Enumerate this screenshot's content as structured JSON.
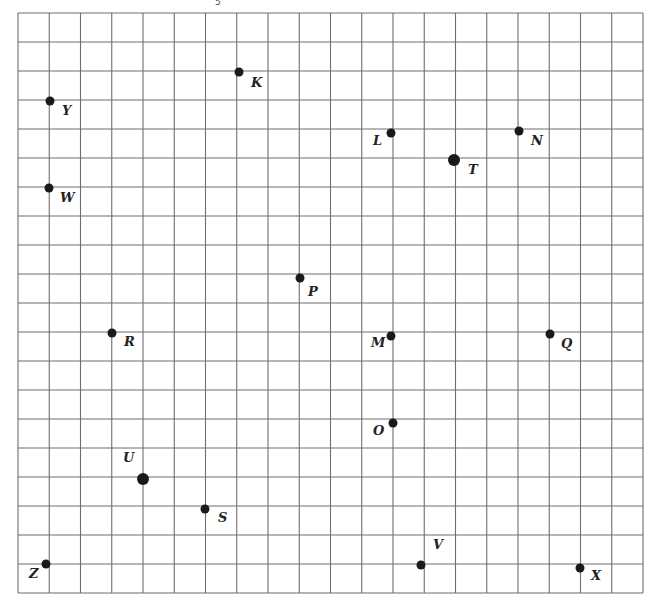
{
  "top_clipped_text": "5",
  "grid": {
    "left": 18,
    "top": 13,
    "right": 643,
    "bottom": 593,
    "cols": 20,
    "rows": 20,
    "line_color": "#6e6e6e",
    "line_width": 1.1
  },
  "point_color": "#1a1a1a",
  "label_color": "#222222",
  "points": [
    {
      "name": "K",
      "x": 239,
      "y": 72,
      "r": 4.5,
      "lx": 251,
      "ly": 87
    },
    {
      "name": "Y",
      "x": 50,
      "y": 101,
      "r": 4.5,
      "lx": 62,
      "ly": 115
    },
    {
      "name": "L",
      "x": 391,
      "y": 133,
      "r": 4.5,
      "lx": 373,
      "ly": 145
    },
    {
      "name": "N",
      "x": 519,
      "y": 131,
      "r": 4.5,
      "lx": 531,
      "ly": 145
    },
    {
      "name": "T",
      "x": 454,
      "y": 160,
      "r": 6,
      "lx": 468,
      "ly": 174
    },
    {
      "name": "W",
      "x": 49,
      "y": 188,
      "r": 4.5,
      "lx": 60,
      "ly": 202
    },
    {
      "name": "P",
      "x": 300,
      "y": 278,
      "r": 4.5,
      "lx": 308,
      "ly": 296
    },
    {
      "name": "R",
      "x": 112,
      "y": 333,
      "r": 4.5,
      "lx": 124,
      "ly": 346
    },
    {
      "name": "M",
      "x": 391,
      "y": 336,
      "r": 4.5,
      "lx": 371,
      "ly": 347
    },
    {
      "name": "Q",
      "x": 550,
      "y": 334,
      "r": 4.5,
      "lx": 561,
      "ly": 348
    },
    {
      "name": "O",
      "x": 393,
      "y": 423,
      "r": 4.5,
      "lx": 373,
      "ly": 435
    },
    {
      "name": "U",
      "x": 143,
      "y": 479,
      "r": 6,
      "lx": 123,
      "ly": 462
    },
    {
      "name": "S",
      "x": 205,
      "y": 509,
      "r": 4.5,
      "lx": 218,
      "ly": 522
    },
    {
      "name": "V",
      "x": 421,
      "y": 565,
      "r": 4.5,
      "lx": 433,
      "ly": 549
    },
    {
      "name": "Z",
      "x": 46,
      "y": 564,
      "r": 4.5,
      "lx": 29,
      "ly": 578
    },
    {
      "name": "X",
      "x": 580,
      "y": 568,
      "r": 4.5,
      "lx": 591,
      "ly": 580
    }
  ]
}
